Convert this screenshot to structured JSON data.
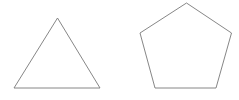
{
  "canvas": {
    "width": 239,
    "height": 100,
    "background_color": "#ffffff",
    "title": "Geometric shapes: triangle and pentagon"
  },
  "style": {
    "stroke_color": "#787878",
    "fill_color": "#ffffff",
    "stroke_width": 0.9
  },
  "shapes": [
    {
      "name": "triangle",
      "label": "Triangle",
      "sides": 3,
      "points": "57.5,18 100,88 14,88",
      "vertices": [
        {
          "x": 57.5,
          "y": 18
        },
        {
          "x": 100,
          "y": 88
        },
        {
          "x": 14,
          "y": 88
        }
      ],
      "bbox": {
        "x": 14,
        "y": 18,
        "width": 86,
        "height": 70
      },
      "baseline_y": 88
    },
    {
      "name": "pentagon",
      "label": "Pentagon",
      "sides": 5,
      "points": "186.5,3 231.5,33 216,88 155,88 140,33",
      "vertices": [
        {
          "x": 186.5,
          "y": 3
        },
        {
          "x": 231.5,
          "y": 33
        },
        {
          "x": 216,
          "y": 88
        },
        {
          "x": 155,
          "y": 88
        },
        {
          "x": 140,
          "y": 33
        }
      ],
      "bbox": {
        "x": 140,
        "y": 3,
        "width": 91.5,
        "height": 85
      },
      "baseline_y": 88
    }
  ]
}
